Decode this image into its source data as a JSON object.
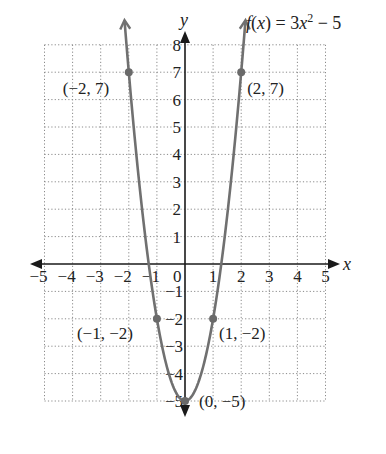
{
  "chart_data": {
    "type": "line",
    "title_parts": {
      "f": "f",
      "lparen": "(",
      "x": "x",
      "rparen_eq": ") = 3",
      "x2": "x",
      "exp": "2",
      "tail": " − 5"
    },
    "xlabel": "x",
    "ylabel": "y",
    "xlim": [
      -5,
      5
    ],
    "ylim": [
      -5,
      8
    ],
    "grid": true,
    "x_ticks": [
      "−5",
      "−4",
      "−3",
      "−2",
      "−1",
      "0",
      "1",
      "2",
      "3",
      "4",
      "5"
    ],
    "y_ticks_pos": [
      "1",
      "2",
      "3",
      "4",
      "5",
      "6",
      "7",
      "8"
    ],
    "y_ticks_neg": [
      "−1",
      "−2",
      "−3",
      "−4",
      "−5"
    ],
    "function": "3x^2 - 5",
    "series": [
      {
        "name": "f(x) = 3x² − 5",
        "x": [
          -2,
          -1,
          0,
          1,
          2
        ],
        "y": [
          7,
          -2,
          -5,
          -2,
          7
        ]
      }
    ],
    "points": [
      {
        "x": -2,
        "y": 7,
        "label": "(−2, 7)"
      },
      {
        "x": 2,
        "y": 7,
        "label": "(2, 7)"
      },
      {
        "x": -1,
        "y": -2,
        "label": "(−1, −2)"
      },
      {
        "x": 1,
        "y": -2,
        "label": "(1, −2)"
      },
      {
        "x": 0,
        "y": -5,
        "label": "(0, −5)"
      }
    ]
  },
  "colors": {
    "curve": "#707070",
    "axis": "#1a1a1a",
    "grid": "#8a8a8a",
    "point": "#6a6a6a"
  }
}
